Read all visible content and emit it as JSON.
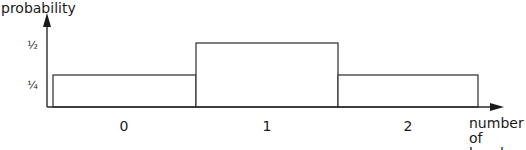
{
  "chart_data": {
    "type": "bar",
    "title": "",
    "xlabel": "number of heads",
    "xlabel_lines": [
      "number",
      "of heads"
    ],
    "ylabel": "probability",
    "categories": [
      "0",
      "1",
      "2"
    ],
    "values": [
      0.25,
      0.5,
      0.25
    ],
    "value_labels": [
      "¼",
      "½",
      "¼"
    ],
    "ytick_labels": [
      "¼",
      "½"
    ],
    "ytick_values": [
      0.25,
      0.5
    ],
    "ylim": [
      0,
      0.6
    ],
    "grid": false,
    "legend": null,
    "bar_style": "outlined histogram, adjacent bars",
    "stroke_color": "#333333",
    "fill_color": "#ffffff"
  },
  "axes": {
    "y_label": "probability",
    "x_label_line1": "number",
    "x_label_line2": "of heads",
    "y_ticks": [
      "½",
      "¼"
    ],
    "x_ticks": [
      "0",
      "1",
      "2"
    ]
  }
}
